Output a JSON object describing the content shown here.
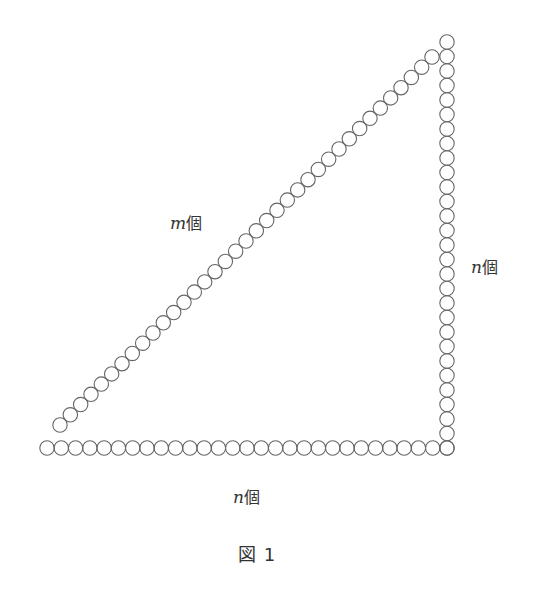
{
  "figure": {
    "caption": "図 1",
    "circle_stroke": "#666666",
    "circle_radius": 7.2,
    "rows": {
      "bottom": {
        "count": 29,
        "start": [
          47,
          448
        ],
        "end": [
          447,
          448
        ]
      },
      "vertical": {
        "count": 29,
        "start": [
          447,
          448
        ],
        "end": [
          447,
          42
        ]
      },
      "diagonal": {
        "count": 37,
        "start": [
          60,
          425
        ],
        "end": [
          432,
          57
        ]
      }
    },
    "labels": {
      "diagonal": {
        "var": "m",
        "unit": "個"
      },
      "vertical": {
        "var": "n",
        "unit": "個"
      },
      "bottom": {
        "var": "n",
        "unit": "個"
      }
    }
  }
}
